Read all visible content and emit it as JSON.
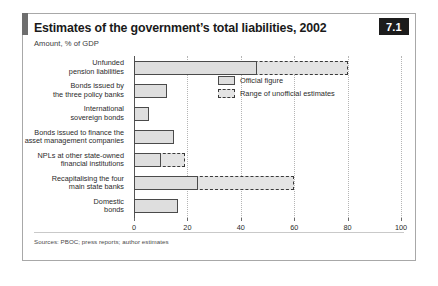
{
  "figure": {
    "number": "7.1",
    "title": "Estimates of the government’s total liabilities, 2002",
    "subtitle": "Amount, % of GDP",
    "source": "Sources: PBOC; press reports; author estimates"
  },
  "legend": {
    "items": [
      {
        "label": "Official figure",
        "style": "solid",
        "color": "#dedede"
      },
      {
        "label": "Range of unofficial estimates",
        "style": "dashed",
        "color": "#e4e4e4"
      }
    ]
  },
  "chart_data": {
    "type": "bar",
    "orientation": "horizontal",
    "title": "Estimates of the government’s total liabilities, 2002",
    "subtitle": "Amount, % of GDP",
    "xlabel": "",
    "ylabel": "",
    "xlim": [
      0,
      100
    ],
    "xticks": [
      0,
      20,
      40,
      60,
      80,
      100
    ],
    "grid": true,
    "legend_position": "inside-right",
    "categories": [
      "Unfunded\npension liabilities",
      "Bonds issued by\nthe three policy banks",
      "International\nsovereign bonds",
      "Bonds issued to finance the\nasset management companies",
      "NPLs at other state-owned\nfinancial institutions",
      "Recapitalising the four\nmain state banks",
      "Domestic\nbonds"
    ],
    "series": [
      {
        "name": "Official figure",
        "values": [
          46,
          12.5,
          5.5,
          15,
          10,
          24,
          16.5
        ]
      },
      {
        "name": "Range of unofficial estimates",
        "values": [
          80,
          null,
          null,
          null,
          19,
          60,
          null
        ]
      }
    ]
  }
}
